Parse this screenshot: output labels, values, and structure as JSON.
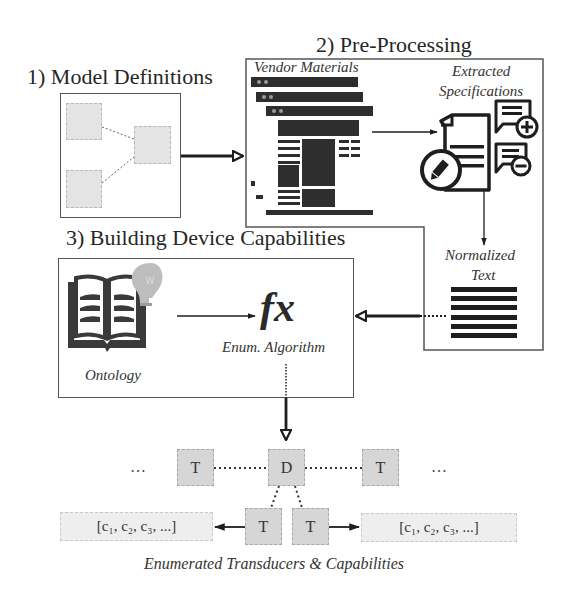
{
  "sections": {
    "model_definitions": {
      "title": "1) Model Definitions"
    },
    "pre_processing": {
      "title": "2) Pre-Processing",
      "vendor_materials_label": "Vendor Materials",
      "extracted_specifications_label_line1": "Extracted",
      "extracted_specifications_label_line2": "Specifications",
      "normalized_text_label_line1": "Normalized",
      "normalized_text_label_line2": "Text"
    },
    "building_capabilities": {
      "title": "3) Building Device Capabilities",
      "ontology_label": "Ontology",
      "function_symbol": "fx",
      "algorithm_label": "Enum. Algorithm"
    }
  },
  "graph": {
    "ellipsis_left": "…",
    "ellipsis_right": "…",
    "nodes": {
      "t_left": "T",
      "d_center": "D",
      "t_right": "T",
      "t_bottom_left": "T",
      "t_bottom_right": "T"
    },
    "capabilities_left": "[c₁, c₂, c₃, ...]",
    "capabilities_right": "[c₁, c₂, c₃, ...]",
    "caption": "Enumerated Transducers & Capabilities"
  },
  "colors": {
    "frame": "#555555",
    "icon_dark": "#1e1e1e",
    "node_fill": "#d6d6d6",
    "light_fill": "#e4e4e4",
    "bulb": "#bdbdbd"
  }
}
